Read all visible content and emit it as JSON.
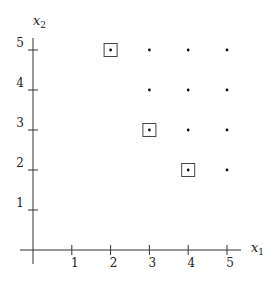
{
  "chart_data": {
    "type": "scatter",
    "title": "",
    "xlabel": "x1",
    "ylabel": "x2",
    "x_ticks": [
      "1",
      "2",
      "3",
      "4",
      "5"
    ],
    "y_ticks": [
      "1",
      "2",
      "3",
      "4",
      "5"
    ],
    "xlim": [
      0,
      5
    ],
    "ylim": [
      0,
      5
    ],
    "grid": false,
    "points": [
      {
        "x": 2,
        "y": 5,
        "boxed": true
      },
      {
        "x": 3,
        "y": 5,
        "boxed": false
      },
      {
        "x": 4,
        "y": 5,
        "boxed": false
      },
      {
        "x": 5,
        "y": 5,
        "boxed": false
      },
      {
        "x": 3,
        "y": 4,
        "boxed": false
      },
      {
        "x": 4,
        "y": 4,
        "boxed": false
      },
      {
        "x": 5,
        "y": 4,
        "boxed": false
      },
      {
        "x": 3,
        "y": 3,
        "boxed": true
      },
      {
        "x": 4,
        "y": 3,
        "boxed": false
      },
      {
        "x": 5,
        "y": 3,
        "boxed": false
      },
      {
        "x": 4,
        "y": 2,
        "boxed": true
      },
      {
        "x": 5,
        "y": 2,
        "boxed": false
      }
    ]
  },
  "axes": {
    "x_label_main": "x",
    "x_label_sub": "1",
    "y_label_main": "x",
    "y_label_sub": "2"
  }
}
